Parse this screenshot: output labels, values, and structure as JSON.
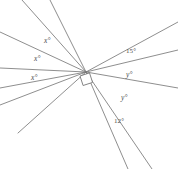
{
  "figure": {
    "type": "angles-at-a-point-diagram",
    "background_color": "#ffffff",
    "line_color": "#7a7a7a",
    "label_color": "#4a4a4a",
    "canvas": {
      "width": 178,
      "height": 169
    },
    "vertex": {
      "x": 86,
      "y": 72
    },
    "right_angle_marker": {
      "present": true,
      "x": 80,
      "y": 76,
      "size": 10,
      "rotation_deg": -18
    },
    "rays": [
      {
        "id": "ray-1",
        "to_x": 22,
        "to_y": 0
      },
      {
        "id": "ray-2",
        "to_x": 50,
        "to_y": 0
      },
      {
        "id": "ray-3",
        "to_x": 0,
        "to_y": 32
      },
      {
        "id": "ray-4",
        "to_x": 0,
        "to_y": 68
      },
      {
        "id": "ray-5",
        "to_x": 0,
        "to_y": 88
      },
      {
        "id": "ray-6",
        "to_x": 0,
        "to_y": 105
      },
      {
        "id": "ray-7",
        "to_x": 18,
        "to_y": 133
      },
      {
        "id": "ray-8",
        "to_x": 128,
        "to_y": 169
      },
      {
        "id": "ray-9",
        "to_x": 152,
        "to_y": 169
      },
      {
        "id": "ray-10",
        "to_x": 178,
        "to_y": 88
      },
      {
        "id": "ray-11",
        "to_x": 178,
        "to_y": 50
      },
      {
        "id": "ray-12",
        "to_x": 178,
        "to_y": 22
      }
    ],
    "labels": [
      {
        "id": "label-x-1",
        "text": "x°",
        "x": 44,
        "y": 37,
        "style": "italic"
      },
      {
        "id": "label-x-2",
        "text": "x°",
        "x": 34,
        "y": 55,
        "style": "italic"
      },
      {
        "id": "label-x-3",
        "text": "x°",
        "x": 31,
        "y": 74,
        "style": "italic"
      },
      {
        "id": "label-15",
        "text": "15°",
        "x": 126,
        "y": 48,
        "style": "numeric"
      },
      {
        "id": "label-y-1",
        "text": "y°",
        "x": 126,
        "y": 71,
        "style": "italic"
      },
      {
        "id": "label-y-2",
        "text": "y°",
        "x": 121,
        "y": 94,
        "style": "italic"
      },
      {
        "id": "label-12",
        "text": "12°",
        "x": 114,
        "y": 118,
        "style": "numeric"
      }
    ]
  }
}
